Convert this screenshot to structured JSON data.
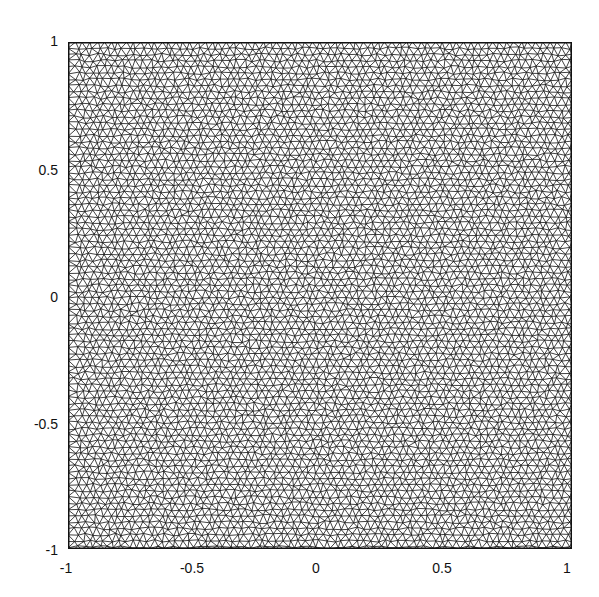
{
  "chart_data": {
    "type": "scatter",
    "subtype": "triangular-mesh",
    "title": "",
    "xlabel": "",
    "ylabel": "",
    "xlim": [
      -1,
      1
    ],
    "ylim": [
      -1,
      1
    ],
    "grid": false,
    "legend": null,
    "x_ticks": [
      {
        "value": -1,
        "label": "-1"
      },
      {
        "value": -0.5,
        "label": "-0.5"
      },
      {
        "value": 0,
        "label": "0"
      },
      {
        "value": 0.5,
        "label": "0.5"
      },
      {
        "value": 1,
        "label": "1"
      }
    ],
    "y_ticks": [
      {
        "value": 1,
        "label": "1"
      },
      {
        "value": 0.5,
        "label": "0.5"
      },
      {
        "value": 0,
        "label": "0"
      },
      {
        "value": -0.5,
        "label": "-0.5"
      },
      {
        "value": -1,
        "label": "-1"
      }
    ],
    "mesh_color": "#111111",
    "background_color": "#ffffff"
  }
}
